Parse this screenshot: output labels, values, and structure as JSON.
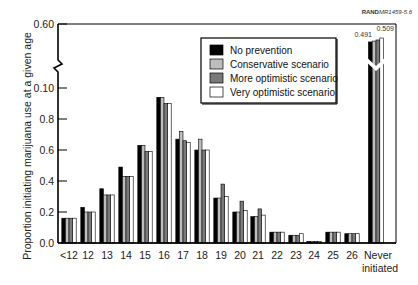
{
  "chart_data": {
    "type": "bar",
    "title": "",
    "credit": {
      "bold": "RAND",
      "italic": "MR1459-5.6"
    },
    "xlabel": "",
    "ylabel": "Proportion initiating marijuana use at a given age",
    "y_ticks": [
      {
        "label": "0.0",
        "value": 0.0
      },
      {
        "label": "0.2",
        "value": 0.2
      },
      {
        "label": "0.4",
        "value": 0.4
      },
      {
        "label": "0.6",
        "value": 0.6
      },
      {
        "label": "0.8",
        "value": 0.8
      },
      {
        "label": "0.10",
        "value": 1.0
      },
      {
        "label": "0.60",
        "value": 1.4
      }
    ],
    "axis_break": true,
    "grid": false,
    "legend_position": "upper right (inside plot)",
    "categories": [
      "<12",
      "12",
      "13",
      "14",
      "15",
      "16",
      "17",
      "18",
      "19",
      "20",
      "21",
      "22",
      "23",
      "24",
      "25",
      "26",
      "Never initiated"
    ],
    "series": [
      {
        "name": "No prevention",
        "color": "#000000",
        "values": [
          0.16,
          0.23,
          0.35,
          0.49,
          0.63,
          0.94,
          0.67,
          0.6,
          0.29,
          0.2,
          0.17,
          0.07,
          0.05,
          0.01,
          0.07,
          0.06,
          0.491
        ]
      },
      {
        "name": "Conservative scenario",
        "color": "#bdbdbd",
        "values": [
          0.16,
          0.2,
          0.31,
          0.43,
          0.63,
          0.94,
          0.72,
          0.67,
          0.29,
          0.2,
          0.17,
          0.07,
          0.05,
          0.01,
          0.07,
          0.06,
          0.495
        ]
      },
      {
        "name": "More optimistic scenario",
        "color": "#7a7a7a",
        "values": [
          0.16,
          0.2,
          0.31,
          0.43,
          0.59,
          0.9,
          0.66,
          0.6,
          0.38,
          0.27,
          0.22,
          0.07,
          0.05,
          0.01,
          0.07,
          0.06,
          0.5
        ]
      },
      {
        "name": "Very optimistic scenario",
        "color": "#ffffff",
        "values": [
          0.16,
          0.2,
          0.31,
          0.43,
          0.59,
          0.9,
          0.65,
          0.6,
          0.3,
          0.21,
          0.18,
          0.07,
          0.06,
          0.01,
          0.07,
          0.06,
          0.509
        ]
      }
    ],
    "annotations": [
      {
        "text": "0.491",
        "target": "Never initiated / No prevention"
      },
      {
        "text": "0.509",
        "target": "Never initiated / Very optimistic scenario"
      }
    ]
  }
}
